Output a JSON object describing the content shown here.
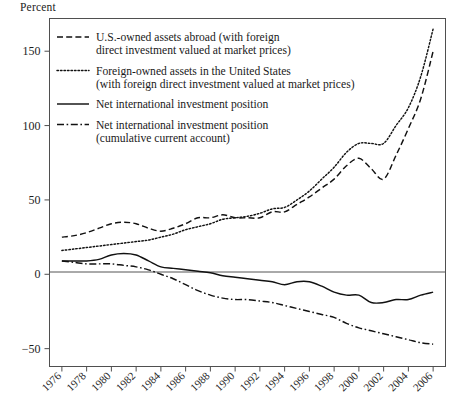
{
  "figure": {
    "y_axis_title": "Percent",
    "background": "#ffffff",
    "ink_color": "#111111",
    "frame_color": "#4f4f4f"
  },
  "chart_data": {
    "type": "line",
    "title": "",
    "subtitle": "",
    "xlabel": "",
    "ylabel": "Percent",
    "xlim": [
      1975,
      2007
    ],
    "ylim": [
      -62,
      172
    ],
    "yticks": [
      -50,
      0,
      50,
      100,
      150
    ],
    "ytick_labels": [
      "-50",
      "0",
      "50",
      "100",
      "150"
    ],
    "xticks": [
      1976,
      1978,
      1980,
      1982,
      1984,
      1986,
      1988,
      1990,
      1992,
      1994,
      1996,
      1998,
      2000,
      2002,
      2004,
      2006
    ],
    "xtick_labels": [
      "1976",
      "1978",
      "1980",
      "1982",
      "1984",
      "1986",
      "1988",
      "1990",
      "1992",
      "1994",
      "1996",
      "1998",
      "2000",
      "2002",
      "2004",
      "2006"
    ],
    "xtick_rotation": 45,
    "grid": false,
    "zero_line": true,
    "legend_position": "upper-left",
    "x": [
      1976,
      1977,
      1978,
      1979,
      1980,
      1981,
      1982,
      1983,
      1984,
      1985,
      1986,
      1987,
      1988,
      1989,
      1990,
      1991,
      1992,
      1993,
      1994,
      1995,
      1996,
      1997,
      1998,
      1999,
      2000,
      2001,
      2002,
      2003,
      2004,
      2005,
      2006
    ],
    "series": [
      {
        "name": "U.S.-owned assets abroad (with foreign direct investment valued at market prices)",
        "style": "dashed",
        "values": [
          25,
          26,
          28,
          31,
          34,
          35,
          34,
          31,
          29,
          31,
          34,
          38,
          38,
          40,
          38,
          38,
          38,
          42,
          42,
          47,
          52,
          58,
          64,
          73,
          78,
          71,
          64,
          80,
          98,
          118,
          150
        ]
      },
      {
        "name": "Foreign-owned assets in the United States (with foreign direct investment valued at market prices)",
        "style": "dotted",
        "values": [
          16,
          17,
          18,
          19,
          20,
          21,
          22,
          23,
          25,
          27,
          30,
          32,
          34,
          37,
          38,
          39,
          41,
          44,
          45,
          50,
          56,
          64,
          72,
          82,
          88,
          88,
          88,
          100,
          112,
          133,
          165
        ]
      },
      {
        "name": "Net international investment position",
        "style": "solid",
        "values": [
          9,
          9,
          9,
          10,
          13,
          14,
          13,
          9,
          5,
          4,
          3,
          2,
          1,
          -1,
          -2,
          -3,
          -4,
          -5,
          -7,
          -5,
          -5,
          -8,
          -12,
          -14,
          -14,
          -19,
          -19,
          -17,
          -17,
          -14,
          -12
        ]
      },
      {
        "name": "Net international investment position (cumulative current account)",
        "style": "dash-dot",
        "values": [
          9,
          8,
          7,
          7,
          7,
          6,
          5,
          3,
          0,
          -3,
          -7,
          -11,
          -14,
          -16,
          -17,
          -17,
          -18,
          -19,
          -21,
          -23,
          -25,
          -27,
          -29,
          -33,
          -36,
          -38,
          -40,
          -42,
          -44,
          -46,
          -47
        ]
      }
    ]
  },
  "legend": {
    "entries": [
      {
        "style": "dashed",
        "line1": "U.S.-owned assets abroad (with foreign",
        "line2": "direct investment valued at market prices)"
      },
      {
        "style": "dotted",
        "line1": "Foreign-owned assets in the United States",
        "line2": "(with foreign direct investment valued at market prices)"
      },
      {
        "style": "solid",
        "line1": "Net international investment position",
        "line2": ""
      },
      {
        "style": "dash-dot",
        "line1": "Net international investment position",
        "line2": "(cumulative current account)"
      }
    ]
  }
}
